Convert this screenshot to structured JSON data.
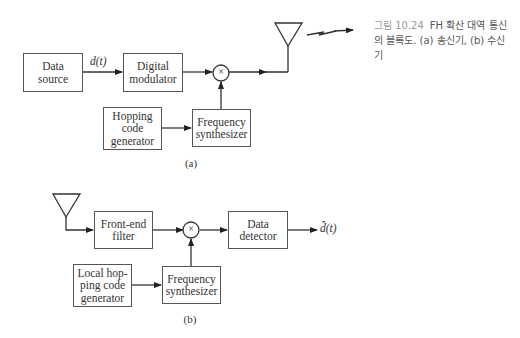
{
  "caption": {
    "figure_number": "그림 10.24",
    "text": "FH 확산 대역 통신의 블록도. (a) 송신기, (b) 수신기"
  },
  "transmitter": {
    "label": "(a)",
    "signal_label": "d(t)",
    "blocks": {
      "data_source": "Data\nsource",
      "digital_modulator": "Digital\nmodulator",
      "hopping_code_generator": "Hopping\ncode\ngenerator",
      "frequency_synthesizer": "Frequency\nsynthesizer"
    },
    "multiplier_symbol": "×"
  },
  "receiver": {
    "label": "(b)",
    "output_label": "d̂(t)",
    "blocks": {
      "front_end_filter": "Front-end\nfilter",
      "data_detector": "Data\ndetector",
      "local_hopping_code_generator": "Local hop-\nping code\ngenerator",
      "frequency_synthesizer": "Frequency\nsynthesizer"
    },
    "multiplier_symbol": "×"
  }
}
